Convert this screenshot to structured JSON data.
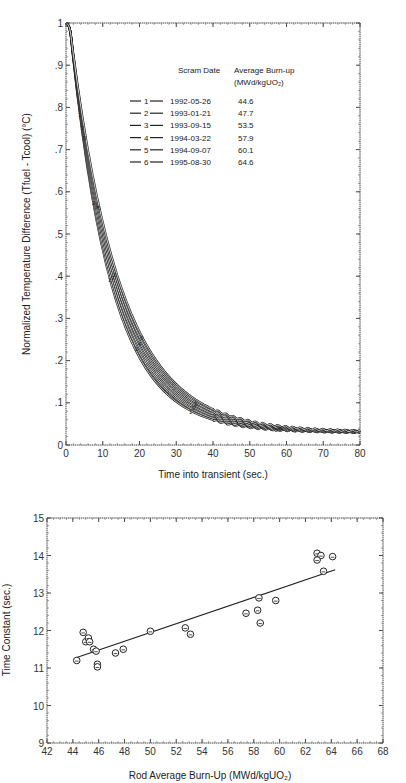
{
  "chart_data": [
    {
      "type": "line",
      "title": "",
      "xlabel": "Time into transient (sec.)",
      "ylabel": "Normalized Temperature Difference (Tfuel - Tcool) (°C)",
      "xlim": [
        0,
        80
      ],
      "ylim": [
        0,
        1
      ],
      "x_ticks": [
        "0",
        "10",
        "20",
        "30",
        "40",
        "50",
        "60",
        "70",
        "80"
      ],
      "y_ticks": [
        "0",
        ".1",
        ".2",
        ".3",
        ".4",
        ".5",
        ".6",
        ".7",
        ".8",
        ".9",
        "1"
      ],
      "grid": false,
      "legend_position": "upper-middle",
      "legend_headers": [
        "Scram Date",
        "Average Burn-up",
        "(MWd/kgUO2)"
      ],
      "x": [
        0,
        5,
        10,
        15,
        20,
        30,
        40,
        50,
        60,
        70,
        80
      ],
      "series": [
        {
          "name": "1",
          "scram_date": "1992-05-26",
          "burnup": "44.6",
          "tau": 11.2,
          "values": [
            1.0,
            0.74,
            0.484,
            0.321,
            0.216,
            0.106,
            0.061,
            0.043,
            0.035,
            0.032,
            0.031
          ]
        },
        {
          "name": "2",
          "scram_date": "1993-01-21",
          "burnup": "47.7",
          "tau": 11.6,
          "values": [
            1.0,
            0.748,
            0.497,
            0.334,
            0.228,
            0.114,
            0.066,
            0.046,
            0.037,
            0.033,
            0.031
          ]
        },
        {
          "name": "3",
          "scram_date": "1993-09-15",
          "burnup": "53.5",
          "tau": 12.1,
          "values": [
            1.0,
            0.756,
            0.51,
            0.348,
            0.241,
            0.124,
            0.071,
            0.049,
            0.039,
            0.034,
            0.032
          ]
        },
        {
          "name": "4",
          "scram_date": "1994-03-22",
          "burnup": "57.9",
          "tau": 12.6,
          "values": [
            1.0,
            0.764,
            0.523,
            0.362,
            0.254,
            0.133,
            0.077,
            0.052,
            0.04,
            0.035,
            0.032
          ]
        },
        {
          "name": "5",
          "scram_date": "1994-09-07",
          "burnup": "60.1",
          "tau": 13.1,
          "values": [
            1.0,
            0.772,
            0.536,
            0.376,
            0.266,
            0.141,
            0.082,
            0.054,
            0.041,
            0.035,
            0.033
          ]
        },
        {
          "name": "6",
          "scram_date": "1995-08-30",
          "burnup": "64.6",
          "tau": 13.6,
          "values": [
            1.0,
            0.78,
            0.549,
            0.389,
            0.279,
            0.149,
            0.087,
            0.057,
            0.043,
            0.036,
            0.033
          ]
        }
      ]
    },
    {
      "type": "scatter",
      "title": "",
      "xlabel": "Rod Average Burn-Up (MWd/kgUO2)",
      "ylabel": "Time Constant (sec.)",
      "xlim": [
        42,
        68
      ],
      "ylim": [
        9,
        15
      ],
      "x_ticks": [
        "42",
        "44",
        "46",
        "48",
        "50",
        "52",
        "54",
        "56",
        "58",
        "60",
        "62",
        "64",
        "66",
        "68"
      ],
      "y_ticks": [
        "9",
        "10",
        "11",
        "12",
        "13",
        "14",
        "15"
      ],
      "grid": false,
      "series": [
        {
          "name": "measured",
          "marker": "circle",
          "points": [
            [
              44.3,
              11.2
            ],
            [
              44.8,
              11.95
            ],
            [
              45.0,
              11.7
            ],
            [
              45.2,
              11.8
            ],
            [
              45.3,
              11.7
            ],
            [
              45.6,
              11.5
            ],
            [
              45.8,
              11.45
            ],
            [
              45.9,
              11.1
            ],
            [
              45.9,
              11.03
            ],
            [
              47.3,
              11.4
            ],
            [
              47.9,
              11.5
            ],
            [
              50.0,
              11.98
            ],
            [
              52.7,
              12.07
            ],
            [
              53.1,
              11.9
            ],
            [
              57.4,
              12.46
            ],
            [
              58.3,
              12.54
            ],
            [
              58.4,
              12.87
            ],
            [
              58.5,
              12.2
            ],
            [
              59.7,
              12.8
            ],
            [
              62.9,
              14.06
            ],
            [
              63.2,
              14.0
            ],
            [
              62.9,
              13.88
            ],
            [
              64.1,
              13.97
            ],
            [
              63.4,
              13.58
            ]
          ]
        },
        {
          "name": "linear-fit",
          "type": "line",
          "points": [
            [
              44.3,
              11.28
            ],
            [
              64.3,
              13.62
            ]
          ]
        }
      ]
    }
  ],
  "top_chart": {
    "xlabel": "Time into transient (sec.)",
    "ylabel": "Normalized Temperature Difference (Tfuel - Tcool) (°C)",
    "legend": {
      "header_date": "Scram Date",
      "header_burnup": "Average Burn-up",
      "header_units": "(MWd/kgUO₂)",
      "rows": [
        {
          "id": "1",
          "date": "1992-05-26",
          "burnup": "44.6"
        },
        {
          "id": "2",
          "date": "1993-01-21",
          "burnup": "47.7"
        },
        {
          "id": "3",
          "date": "1993-09-15",
          "burnup": "53.5"
        },
        {
          "id": "4",
          "date": "1994-03-22",
          "burnup": "57.9"
        },
        {
          "id": "5",
          "date": "1994-09-07",
          "burnup": "60.1"
        },
        {
          "id": "6",
          "date": "1995-08-30",
          "burnup": "64.6"
        }
      ]
    }
  },
  "bottom_chart": {
    "xlabel": "Rod Average Burn-Up (MWd/kgUO₂)",
    "ylabel": "Time Constant (sec.)"
  }
}
